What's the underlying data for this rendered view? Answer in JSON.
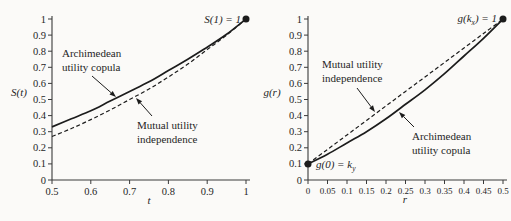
{
  "figure": {
    "background": "#fbfaf8",
    "ink": "#1c1c1c",
    "axis_color": "#3a3a3a"
  },
  "chart_data": [
    {
      "id": "left",
      "type": "line",
      "title": "",
      "xlabel": "t",
      "ylabel": "S(t)",
      "xlim": [
        0.5,
        1
      ],
      "ylim": [
        0,
        1
      ],
      "grid": false,
      "legend_position": "none",
      "xticks": [
        0.5,
        0.6,
        0.7,
        0.8,
        0.9,
        1
      ],
      "xtick_labels": [
        "0.5",
        "0.6",
        "0.7",
        "0.8",
        "0.9",
        "1"
      ],
      "yticks": [
        0,
        0.1,
        0.2,
        0.3,
        0.4,
        0.5,
        0.6,
        0.7,
        0.8,
        0.9,
        1
      ],
      "ytick_labels": [
        "0",
        "0.1",
        "0.2",
        "0.3",
        "0.4",
        "0.5",
        "0.6",
        "0.7",
        "0.8",
        "0.9",
        "1"
      ],
      "series": [
        {
          "name": "Archimedean utility copula",
          "line": "solid",
          "points": [
            [
              0.5,
              0.33
            ],
            [
              0.55,
              0.38
            ],
            [
              0.6,
              0.43
            ],
            [
              0.65,
              0.49
            ],
            [
              0.7,
              0.55
            ],
            [
              0.75,
              0.61
            ],
            [
              0.8,
              0.68
            ],
            [
              0.85,
              0.75
            ],
            [
              0.9,
              0.825
            ],
            [
              0.95,
              0.905
            ],
            [
              1,
              1
            ]
          ]
        },
        {
          "name": "Mutual utility independence",
          "line": "dashed",
          "points": [
            [
              0.5,
              0.27
            ],
            [
              0.55,
              0.32
            ],
            [
              0.6,
              0.375
            ],
            [
              0.65,
              0.435
            ],
            [
              0.7,
              0.5
            ],
            [
              0.75,
              0.565
            ],
            [
              0.8,
              0.64
            ],
            [
              0.85,
              0.72
            ],
            [
              0.9,
              0.81
            ],
            [
              0.95,
              0.9
            ],
            [
              1,
              1
            ]
          ]
        }
      ],
      "endpoints": [
        {
          "x": 1,
          "y": 1,
          "label_parts": [
            {
              "t": "S(1) = 1"
            }
          ],
          "anchor": "end",
          "tx": 241,
          "ty": 23
        }
      ],
      "callouts": [
        {
          "target": "Archimedean utility copula",
          "lines": [
            "Archimedean",
            "utility copula"
          ],
          "tx": 62,
          "ty": 57,
          "arrow": [
            92,
            76,
            116,
            97
          ]
        },
        {
          "target": "Mutual utility independence",
          "lines": [
            "Mutual utility",
            "independence"
          ],
          "tx": 137,
          "ty": 129,
          "arrow": [
            152,
            116,
            136,
            98
          ]
        }
      ]
    },
    {
      "id": "right",
      "type": "line",
      "title": "",
      "xlabel": "r",
      "ylabel": "g(r)",
      "xlim": [
        0,
        0.5
      ],
      "ylim": [
        0,
        1
      ],
      "grid": false,
      "legend_position": "none",
      "xticks": [
        0,
        0.05,
        0.1,
        0.15,
        0.2,
        0.25,
        0.3,
        0.35,
        0.4,
        0.45,
        0.5
      ],
      "xtick_labels": [
        "0",
        "0.05",
        "0.1",
        "0.15",
        "0.2",
        "0.25",
        "0.3",
        "0.35",
        "0.4",
        "0.45",
        "0.5"
      ],
      "yticks": [
        0,
        0.1,
        0.2,
        0.3,
        0.4,
        0.5,
        0.6,
        0.7,
        0.8,
        0.9,
        1
      ],
      "ytick_labels": [
        "0",
        "0.1",
        "0.2",
        "0.3",
        "0.4",
        "0.5",
        "0.6",
        "0.7",
        "0.8",
        "0.9",
        "1"
      ],
      "series": [
        {
          "name": "Archimedean utility copula",
          "line": "solid",
          "points": [
            [
              0,
              0.1
            ],
            [
              0.05,
              0.16
            ],
            [
              0.1,
              0.23
            ],
            [
              0.15,
              0.3
            ],
            [
              0.2,
              0.38
            ],
            [
              0.25,
              0.47
            ],
            [
              0.3,
              0.56
            ],
            [
              0.35,
              0.66
            ],
            [
              0.4,
              0.77
            ],
            [
              0.45,
              0.88
            ],
            [
              0.5,
              1
            ]
          ]
        },
        {
          "name": "Mutual utility independence",
          "line": "dashed",
          "points": [
            [
              0,
              0.1
            ],
            [
              0.05,
              0.19
            ],
            [
              0.1,
              0.28
            ],
            [
              0.15,
              0.37
            ],
            [
              0.2,
              0.46
            ],
            [
              0.25,
              0.55
            ],
            [
              0.3,
              0.64
            ],
            [
              0.35,
              0.73
            ],
            [
              0.4,
              0.82
            ],
            [
              0.45,
              0.91
            ],
            [
              0.5,
              1
            ]
          ]
        }
      ],
      "endpoints": [
        {
          "x": 0.5,
          "y": 1,
          "label_parts": [
            {
              "t": "g(k"
            },
            {
              "t": "x",
              "sub": true
            },
            {
              "t": ") = 1"
            }
          ],
          "anchor": "end",
          "tx": 497,
          "ty": 22
        },
        {
          "x": 0,
          "y": 0.1,
          "label_parts": [
            {
              "t": "g(0) = k"
            },
            {
              "t": "y",
              "sub": true
            }
          ],
          "anchor": "start",
          "tx": 316,
          "ty": 168
        }
      ],
      "callouts": [
        {
          "target": "Mutual utility independence",
          "lines": [
            "Mutual utility",
            "independence"
          ],
          "tx": 322,
          "ty": 68,
          "arrow": [
            357,
            88,
            375,
            112
          ]
        },
        {
          "target": "Archimedean utility copula",
          "lines": [
            "Archimedean",
            "utility copula"
          ],
          "tx": 412,
          "ty": 140,
          "arrow": [
            414,
            127,
            399,
            112
          ]
        }
      ]
    }
  ]
}
